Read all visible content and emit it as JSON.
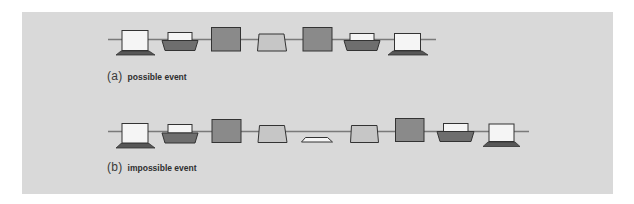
{
  "figure": {
    "background": "#d9d9d9",
    "colors": {
      "line": "#7a7a7a",
      "stroke": "#333333",
      "square_fill": "#8a8a8a",
      "trapezoid_fill": "#c6c6c6",
      "printer_body_fill": "#6e6e6e",
      "laptop_base_fill": "#575757",
      "white_fill": "#f5f5f5"
    },
    "panels": [
      {
        "id": "a",
        "tag": "(a)",
        "caption": "possible event",
        "sequence": [
          "laptop",
          "printer",
          "square",
          "trapezoid",
          "square",
          "printer",
          "laptop"
        ]
      },
      {
        "id": "b",
        "tag": "(b)",
        "caption": "impossible event",
        "sequence": [
          "laptop",
          "printer",
          "square",
          "trapezoid",
          "flat-trapezoid",
          "trapezoid",
          "square",
          "printer",
          "laptop"
        ]
      }
    ]
  }
}
